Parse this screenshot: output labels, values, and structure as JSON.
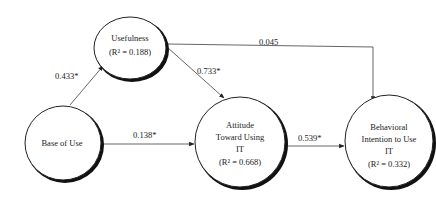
{
  "nodes": {
    "usefulness": {
      "label": "Usefulness",
      "r2": "(R² = 0.188)"
    },
    "ease_of_use": {
      "label": "Base of Use"
    },
    "attitude": {
      "lines": [
        "Attitude",
        "Toward  Using",
        "IT"
      ],
      "r2": "(R² = 0.668)"
    },
    "behavioral_intention": {
      "lines": [
        "Behavioral",
        "Intention to Use",
        "IT"
      ],
      "r2": "(R² = 0.332)"
    }
  },
  "edges": {
    "ease_to_usefulness": {
      "from": "Base of Use",
      "to": "Usefulness",
      "label": "0.433*"
    },
    "usefulness_to_attitude": {
      "from": "Usefulness",
      "to": "Attitude Toward Using IT",
      "label": "0.733*"
    },
    "usefulness_to_intention": {
      "from": "Usefulness",
      "to": "Behavioral Intention to Use IT",
      "label": "0.045"
    },
    "ease_to_attitude": {
      "from": "Base of Use",
      "to": "Attitude Toward Using IT",
      "label": "0.138*"
    },
    "attitude_to_intention": {
      "from": "Attitude Toward Using IT",
      "to": "Behavioral Intention to Use IT",
      "label": "0.539*"
    }
  }
}
